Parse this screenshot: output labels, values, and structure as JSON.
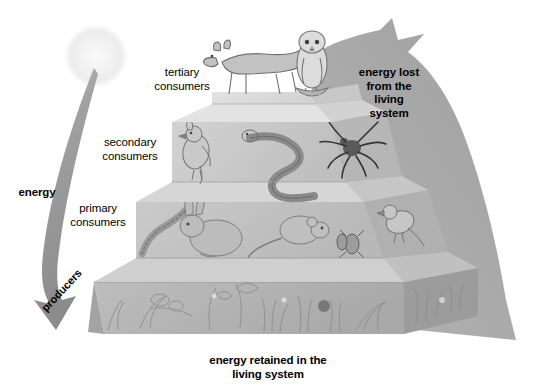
{
  "diagram": {
    "style": "grayscale pencil illustration",
    "labels": {
      "tertiary": "tertiary\nconsumers",
      "secondary": "secondary\nconsumers",
      "primary": "primary\nconsumers",
      "producers": "producers",
      "energy": "energy",
      "energy_lost": "energy lost\nfrom the\nliving\nsystem",
      "energy_retained": "energy retained in the\nliving system"
    },
    "tiers": [
      {
        "name": "tertiary-consumers",
        "level": 4,
        "label": "tertiary consumers",
        "organisms": [
          "wolf",
          "owl"
        ],
        "face_color": "#d9d9d9",
        "top_color": "#e6e6e6",
        "side_color": "#c2c2c2"
      },
      {
        "name": "secondary-consumers",
        "level": 3,
        "label": "secondary consumers",
        "organisms": [
          "bird",
          "snake",
          "spider"
        ],
        "face_color": "#c9c9c9",
        "top_color": "#dddddd",
        "side_color": "#b2b2b2"
      },
      {
        "name": "primary-consumers",
        "level": 2,
        "label": "primary consumers",
        "organisms": [
          "caterpillar",
          "rabbit",
          "mouse",
          "beetle",
          "sparrow"
        ],
        "face_color": "#c4c4c4",
        "top_color": "#d5d5d5",
        "side_color": "#ababab"
      },
      {
        "name": "producers",
        "level": 1,
        "label": "producers",
        "organisms": [
          "grass",
          "clover",
          "strawberry",
          "wildflowers",
          "leaves",
          "vines"
        ],
        "face_color": "#b5b5b5",
        "top_color": "#c6c6c6",
        "side_color": "#9a9a9a"
      }
    ],
    "sun": {
      "name": "sun",
      "color": "#f2f2f2",
      "cx": 96,
      "cy": 56,
      "r": 30
    },
    "energy_arrow": {
      "name": "energy-input-arrow",
      "color": "#8f8f8f",
      "direction": "sun-to-producers"
    },
    "energy_lost_arrow": {
      "name": "energy-lost-arrow",
      "color": "#a8a8a8",
      "direction": "up-right"
    },
    "colors": {
      "background": "#ffffff",
      "text": "#000000",
      "arrow_gray": "#a8a8a8",
      "energy_gray": "#8f8f8f",
      "pyramid_light": "#e6e6e6",
      "pyramid_mid": "#c4c4c4",
      "pyramid_dark": "#9a9a9a"
    }
  }
}
